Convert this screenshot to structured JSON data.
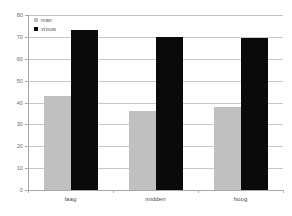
{
  "chart_data": {
    "type": "bar",
    "title": "",
    "subtitle": "",
    "xlabel": "",
    "ylabel": "",
    "categories": [
      "laag",
      "midden",
      "hoog"
    ],
    "series": [
      {
        "name": "man",
        "color": "#c0c0c0",
        "values": [
          43,
          36,
          38
        ]
      },
      {
        "name": "vrouw",
        "color": "#0a0a0a",
        "values": [
          73,
          70,
          69.5
        ]
      }
    ],
    "ylim": [
      0,
      80
    ],
    "yticks": [
      0,
      10,
      20,
      30,
      40,
      50,
      60,
      70,
      80
    ],
    "ytick_labels": [
      "0",
      "10",
      "20",
      "30",
      "40",
      "50",
      "60",
      "70",
      "80"
    ],
    "grid": true,
    "grid_axis": "y",
    "legend_position": "top-left",
    "background": "#ffffff",
    "grid_color": "#c8c8c8",
    "axis_color": "#a8a8a8"
  },
  "legend": {
    "items": [
      {
        "label": "man"
      },
      {
        "label": "vrouw"
      }
    ]
  },
  "axis": {
    "y_labels": [
      "80",
      "70",
      "60",
      "50",
      "40",
      "30",
      "20",
      "10",
      "0"
    ],
    "x_labels": [
      "laag",
      "midden",
      "hoog"
    ]
  }
}
